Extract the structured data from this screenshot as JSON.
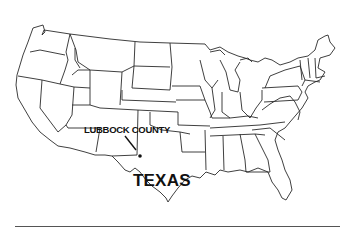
{
  "map": {
    "type": "outline map",
    "region": "United States (contiguous states)",
    "style": "black outline on white",
    "labels": {
      "county": "LUBBOCK COUNTY",
      "state": "TEXAS"
    },
    "marker": {
      "type": "dot with pointer line",
      "location": "Lubbock County, Texas panhandle"
    },
    "colors": {
      "background": "#ffffff",
      "outline": "#2a2a2a",
      "text": "#111111"
    }
  }
}
